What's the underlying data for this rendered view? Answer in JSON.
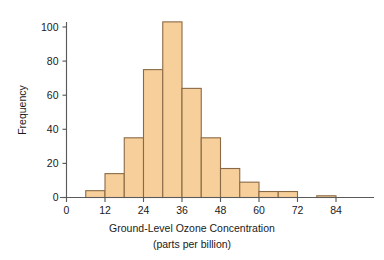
{
  "chart_data": {
    "type": "bar",
    "subtype": "histogram",
    "title": "",
    "xlabel": "Ground-Level Ozone Concentration",
    "xlabel_line2": "(parts per billion)",
    "ylabel": "Frequency",
    "bin_width": 6,
    "bin_starts": [
      6,
      12,
      18,
      24,
      30,
      36,
      42,
      48,
      54,
      60,
      66,
      72,
      78
    ],
    "bin_labels": [
      "6-12",
      "12-18",
      "18-24",
      "24-30",
      "30-36",
      "36-42",
      "42-48",
      "48-54",
      "54-60",
      "60-66",
      "66-72",
      "72-78",
      "78-84"
    ],
    "values": [
      4,
      14,
      35,
      75,
      103,
      64,
      35,
      17,
      9,
      3.5,
      3.5,
      0,
      1
    ],
    "categories": [
      "6",
      "12",
      "18",
      "24",
      "30",
      "36",
      "42",
      "48",
      "54",
      "60",
      "66",
      "72",
      "78"
    ],
    "xlim": [
      0,
      90
    ],
    "ylim": [
      0,
      108
    ],
    "xticks": [
      0,
      12,
      24,
      36,
      48,
      60,
      72,
      84
    ],
    "xtick_labels": [
      "0",
      "12",
      "24",
      "36",
      "48",
      "60",
      "72",
      "84"
    ],
    "yticks": [
      0,
      20,
      40,
      60,
      80,
      100
    ],
    "ytick_labels": [
      "0",
      "20",
      "40",
      "60",
      "80",
      "100"
    ],
    "grid": false,
    "legend": false,
    "bar_fill": "#f7cf9b",
    "bar_stroke": "#8a6a46",
    "axis_color": "#5a5a5a"
  }
}
